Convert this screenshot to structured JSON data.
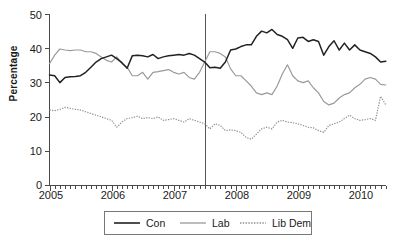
{
  "chart_data": {
    "type": "line",
    "title": "",
    "xlabel": "",
    "ylabel": "Percentage",
    "ylim": [
      0,
      50
    ],
    "yticks": [
      0,
      10,
      20,
      30,
      40,
      50
    ],
    "xlim": [
      2005.0,
      2010.42
    ],
    "xticks": [
      2005,
      2006,
      2007,
      2008,
      2009,
      2010
    ],
    "xtick_labels": [
      "2005",
      "2006",
      "2007",
      "2008",
      "2009",
      "2010"
    ],
    "ytick_labels": [
      "0",
      "10",
      "20",
      "30",
      "40",
      "50"
    ],
    "grid": false,
    "legend_position": "bottom",
    "minor_tick_interval_months": 1,
    "annotations": [
      {
        "type": "vertical-line",
        "x": 2007.5,
        "label": ""
      }
    ],
    "x": [
      2005.0,
      2005.083,
      2005.167,
      2005.25,
      2005.333,
      2005.417,
      2005.5,
      2005.583,
      2005.667,
      2005.75,
      2005.833,
      2005.917,
      2006.0,
      2006.083,
      2006.167,
      2006.25,
      2006.333,
      2006.417,
      2006.5,
      2006.583,
      2006.667,
      2006.75,
      2006.833,
      2006.917,
      2007.0,
      2007.083,
      2007.167,
      2007.25,
      2007.333,
      2007.417,
      2007.5,
      2007.583,
      2007.667,
      2007.75,
      2007.833,
      2007.917,
      2008.0,
      2008.083,
      2008.167,
      2008.25,
      2008.333,
      2008.417,
      2008.5,
      2008.583,
      2008.667,
      2008.75,
      2008.833,
      2008.917,
      2009.0,
      2009.083,
      2009.167,
      2009.25,
      2009.333,
      2009.417,
      2009.5,
      2009.583,
      2009.667,
      2009.75,
      2009.833,
      2009.917,
      2010.0,
      2010.083,
      2010.167,
      2010.25,
      2010.333,
      2010.417
    ],
    "series": [
      {
        "name": "Con",
        "style": "solid",
        "color": "#222222",
        "values": [
          32.2,
          32.0,
          30.0,
          31.5,
          31.7,
          31.8,
          32.0,
          33.0,
          34.5,
          36.0,
          37.0,
          37.5,
          38.0,
          37.0,
          35.8,
          34.2,
          37.8,
          38.0,
          37.8,
          37.5,
          38.2,
          37.0,
          37.5,
          37.8,
          38.0,
          38.2,
          38.0,
          38.5,
          38.0,
          37.0,
          36.0,
          34.3,
          34.5,
          34.2,
          36.0,
          39.5,
          39.8,
          40.5,
          41.0,
          41.0,
          43.5,
          45.0,
          44.5,
          45.5,
          44.0,
          43.5,
          42.5,
          40.0,
          43.0,
          43.2,
          42.0,
          42.5,
          42.0,
          38.0,
          40.5,
          42.2,
          39.5,
          41.5,
          39.5,
          41.0,
          39.5,
          39.0,
          38.5,
          37.5,
          36.0,
          36.2
        ]
      },
      {
        "name": "Lab",
        "style": "solid",
        "color": "#9a9a9a",
        "values": [
          35.5,
          38.0,
          39.8,
          39.5,
          39.3,
          39.5,
          39.5,
          39.0,
          39.0,
          38.5,
          37.5,
          36.5,
          36.0,
          37.5,
          35.5,
          34.5,
          32.0,
          32.0,
          33.0,
          31.0,
          33.0,
          33.2,
          33.5,
          33.8,
          33.0,
          32.5,
          33.0,
          31.5,
          31.0,
          33.0,
          36.0,
          39.0,
          39.0,
          38.5,
          37.5,
          34.0,
          32.0,
          32.0,
          30.5,
          29.0,
          27.0,
          26.5,
          27.0,
          26.5,
          29.0,
          32.5,
          35.2,
          32.0,
          30.5,
          30.0,
          30.5,
          28.5,
          27.0,
          24.5,
          23.5,
          24.0,
          25.5,
          26.5,
          27.0,
          28.5,
          29.5,
          31.0,
          31.5,
          31.0,
          29.5,
          29.3
        ]
      },
      {
        "name": "Lib Dem",
        "style": "dotted",
        "color": "#8f8f8f",
        "values": [
          22.0,
          21.8,
          22.2,
          22.8,
          22.5,
          22.2,
          22.0,
          21.5,
          21.0,
          20.5,
          20.0,
          19.5,
          19.0,
          17.0,
          18.5,
          19.5,
          19.8,
          20.2,
          19.5,
          19.8,
          19.5,
          20.0,
          19.0,
          19.2,
          19.5,
          19.0,
          18.5,
          19.5,
          19.0,
          18.5,
          18.0,
          16.5,
          18.0,
          17.5,
          16.0,
          16.2,
          16.0,
          15.5,
          14.0,
          13.5,
          15.0,
          16.5,
          17.0,
          16.5,
          18.5,
          19.0,
          18.5,
          18.3,
          18.0,
          17.5,
          17.0,
          16.8,
          16.0,
          15.5,
          17.5,
          18.0,
          18.5,
          19.5,
          20.5,
          19.5,
          19.0,
          19.2,
          19.5,
          19.0,
          26.0,
          23.5
        ]
      }
    ]
  },
  "legend": {
    "items": [
      {
        "label": "Con",
        "style": "solid",
        "color": "#222222"
      },
      {
        "label": "Lab",
        "style": "solid",
        "color": "#9a9a9a"
      },
      {
        "label": "Lib Dem",
        "style": "dotted",
        "color": "#8f8f8f"
      }
    ]
  },
  "axes": {
    "y_title": "Percentage"
  }
}
